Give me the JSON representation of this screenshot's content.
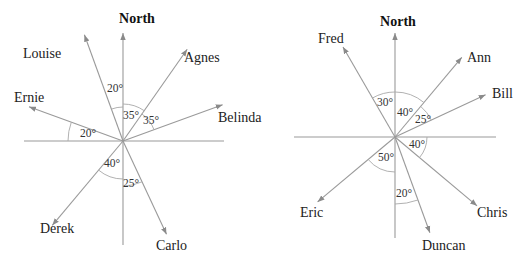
{
  "colors": {
    "line": "#9a9a9a",
    "text": "#222222"
  },
  "diagrams": [
    {
      "name": "left-compass",
      "center": [
        123,
        141
      ],
      "north_label": "North",
      "north_label_pos": [
        137,
        23
      ],
      "axis": {
        "north_end": 33,
        "south_end": 245,
        "west_end": 24,
        "east_end": 224
      },
      "rays": [
        {
          "name": "Louise",
          "bearing": -20,
          "length": 113,
          "label_pos": [
            23,
            58
          ],
          "anchor": "start"
        },
        {
          "name": "Agnes",
          "bearing": 35,
          "length": 112,
          "label_pos": [
            184,
            62
          ],
          "anchor": "start"
        },
        {
          "name": "Belinda",
          "bearing": 70,
          "length": 106,
          "label_pos": [
            218,
            122
          ],
          "anchor": "start"
        },
        {
          "name": "Ernie",
          "bearing": -70,
          "length": 100,
          "label_pos": [
            14,
            102
          ],
          "anchor": "start"
        },
        {
          "name": "Derek",
          "bearing": -140,
          "length": 110,
          "label_pos": [
            40,
            233
          ],
          "anchor": "start"
        },
        {
          "name": "Carlo",
          "bearing": 155,
          "length": 103,
          "label_pos": [
            156,
            250
          ],
          "anchor": "start"
        }
      ],
      "angles": [
        {
          "label": "20°",
          "from": -20,
          "to": 0,
          "r": 34,
          "text_pos": [
            107,
            92
          ]
        },
        {
          "label": "35°",
          "from": 0,
          "to": 35,
          "r": 37,
          "text_pos": [
            123,
            119
          ]
        },
        {
          "label": "35°",
          "from": 35,
          "to": 70,
          "r": 33,
          "text_pos": [
            143,
            124
          ]
        },
        {
          "label": "20°",
          "from": -90,
          "to": -70,
          "r": 55,
          "text_pos": [
            80,
            137
          ]
        },
        {
          "label": "40°",
          "from": -180,
          "to": -140,
          "r": 38,
          "text_pos": [
            104,
            167
          ]
        },
        {
          "label": "25°",
          "from": 155,
          "to": 180,
          "r": 45,
          "text_pos": [
            123,
            187
          ]
        }
      ]
    },
    {
      "name": "right-compass",
      "center": [
        395,
        137
      ],
      "north_label": "North",
      "north_label_pos": [
        398,
        26
      ],
      "axis": {
        "north_end": 33,
        "south_end": 238,
        "west_end": 294,
        "east_end": 496
      },
      "rays": [
        {
          "name": "Fred",
          "bearing": -30,
          "length": 104,
          "label_pos": [
            318,
            43
          ],
          "anchor": "start"
        },
        {
          "name": "Ann",
          "bearing": 40,
          "length": 104,
          "label_pos": [
            467,
            62
          ],
          "anchor": "start"
        },
        {
          "name": "Bill",
          "bearing": 65,
          "length": 100,
          "label_pos": [
            492,
            98
          ],
          "anchor": "start"
        },
        {
          "name": "Chris",
          "bearing": 130,
          "length": 107,
          "label_pos": [
            477,
            217
          ],
          "anchor": "start"
        },
        {
          "name": "Duncan",
          "bearing": 160,
          "length": 102,
          "label_pos": [
            422,
            250
          ],
          "anchor": "start"
        },
        {
          "name": "Eric",
          "bearing": -130,
          "length": 101,
          "label_pos": [
            300,
            217
          ],
          "anchor": "start"
        }
      ],
      "angles": [
        {
          "label": "30°",
          "from": -30,
          "to": 0,
          "r": 45,
          "text_pos": [
            377,
            106
          ]
        },
        {
          "label": "40°",
          "from": 0,
          "to": 40,
          "r": 45,
          "text_pos": [
            397,
            116
          ]
        },
        {
          "label": "25°",
          "from": 40,
          "to": 65,
          "r": 40,
          "text_pos": [
            415,
            123
          ]
        },
        {
          "label": "40°",
          "from": 90,
          "to": 130,
          "r": 32,
          "text_pos": [
            409,
            148
          ]
        },
        {
          "label": "50°",
          "from": -180,
          "to": -130,
          "r": 35,
          "text_pos": [
            378,
            161
          ]
        },
        {
          "label": "20°",
          "from": 160,
          "to": 180,
          "r": 67,
          "text_pos": [
            396,
            197
          ]
        }
      ]
    }
  ]
}
